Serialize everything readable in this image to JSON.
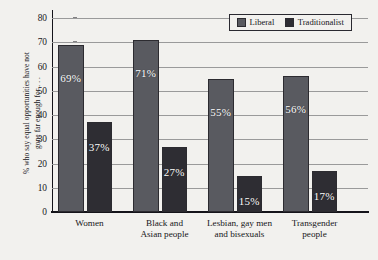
{
  "chart_data": {
    "type": "bar",
    "title": "",
    "xlabel": "",
    "ylabel": "% who say equal opportunities have not\ngone far enough for . . .",
    "ylim": [
      0,
      80
    ],
    "yticks": [
      0,
      10,
      20,
      30,
      40,
      50,
      60,
      70,
      80
    ],
    "grid": true,
    "legend_position": "top-right",
    "categories": [
      "Women",
      "Black and\nAsian people",
      "Lesbian, gay men\nand bisexuals",
      "Transgender\npeople"
    ],
    "series": [
      {
        "name": "Liberal",
        "color": "#595a60",
        "values": [
          69,
          71,
          55,
          56
        ],
        "labels": [
          "69%",
          "71%",
          "55%",
          "56%"
        ]
      },
      {
        "name": "Traditionalist",
        "color": "#2e2d33",
        "values": [
          37,
          27,
          15,
          17
        ],
        "labels": [
          "37%",
          "27%",
          "15%",
          "17%"
        ]
      }
    ]
  }
}
